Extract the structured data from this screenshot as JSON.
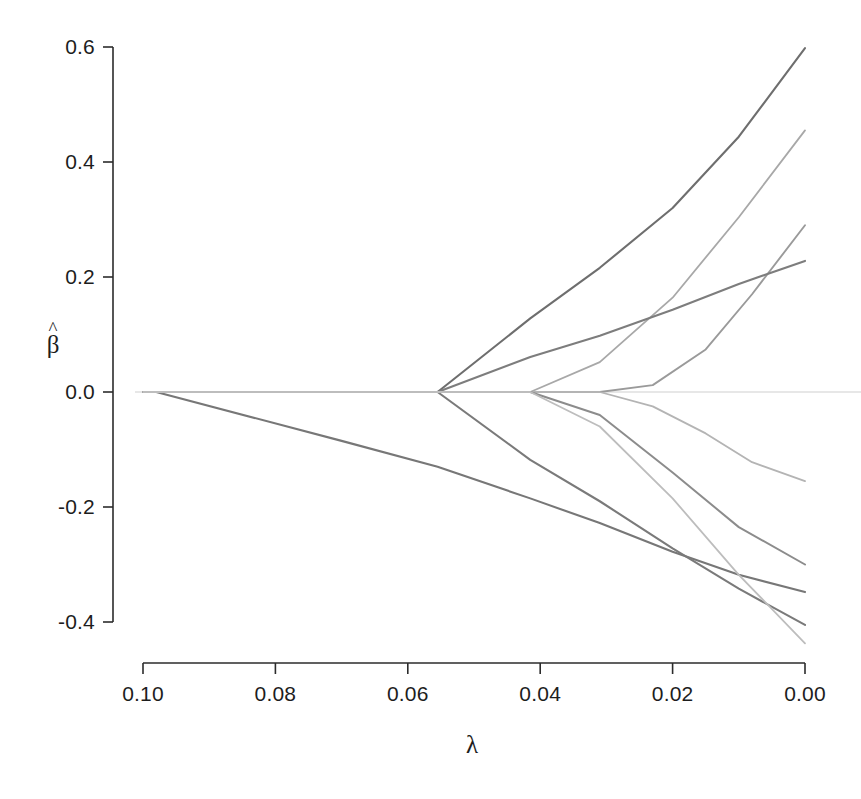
{
  "chart_data": {
    "type": "line",
    "title": "",
    "subtitle": "",
    "xlabel": "λ",
    "ylabel": "β̂",
    "ylabel_base": "β",
    "ylabel_accent": "^",
    "x_ticks": [
      "0.10",
      "0.08",
      "0.06",
      "0.04",
      "0.02",
      "0.00"
    ],
    "x_tick_values": [
      0.1,
      0.08,
      0.06,
      0.04,
      0.02,
      0.0
    ],
    "y_ticks": [
      "0.6",
      "0.4",
      "0.2",
      "0.0",
      "-0.2",
      "-0.4"
    ],
    "y_tick_values": [
      0.6,
      0.4,
      0.2,
      0.0,
      -0.2,
      -0.4
    ],
    "xlim": [
      0.1,
      0.0
    ],
    "ylim": [
      -0.4,
      0.6
    ],
    "x_axis_reversed": true,
    "grid": false,
    "legend": "none",
    "zero_reference_line": true,
    "zero_reference_value": 0.0,
    "axis_style": "r-base-box-less",
    "series": [
      {
        "name": "var1",
        "color": "#6e6e6e",
        "width": 2.1,
        "points": [
          [
            0.1,
            0.0
          ],
          [
            0.0555,
            0.0
          ],
          [
            0.0415,
            0.128
          ],
          [
            0.031,
            0.216
          ],
          [
            0.02,
            0.32
          ],
          [
            0.01,
            0.444
          ],
          [
            0.0,
            0.598
          ]
        ]
      },
      {
        "name": "var2",
        "color": "#a8a8a8",
        "width": 1.8,
        "points": [
          [
            0.1,
            0.0
          ],
          [
            0.0555,
            0.0
          ],
          [
            0.0415,
            0.0
          ],
          [
            0.031,
            0.052
          ],
          [
            0.02,
            0.164
          ],
          [
            0.01,
            0.304
          ],
          [
            0.0,
            0.455
          ]
        ]
      },
      {
        "name": "var3",
        "color": "#9a9a9a",
        "width": 1.9,
        "points": [
          [
            0.1,
            0.0
          ],
          [
            0.0555,
            0.0
          ],
          [
            0.0415,
            0.0
          ],
          [
            0.031,
            0.0
          ],
          [
            0.023,
            0.012
          ],
          [
            0.015,
            0.074
          ],
          [
            0.008,
            0.17
          ],
          [
            0.0,
            0.29
          ]
        ]
      },
      {
        "name": "var4",
        "color": "#7d7d7d",
        "width": 2.1,
        "points": [
          [
            0.1,
            0.0
          ],
          [
            0.0555,
            0.0
          ],
          [
            0.0415,
            0.061
          ],
          [
            0.031,
            0.098
          ],
          [
            0.02,
            0.143
          ],
          [
            0.01,
            0.188
          ],
          [
            0.0,
            0.228
          ]
        ]
      },
      {
        "name": "var5",
        "color": "#b4b4b4",
        "width": 1.8,
        "points": [
          [
            0.1,
            0.0
          ],
          [
            0.0555,
            0.0
          ],
          [
            0.0415,
            0.0
          ],
          [
            0.031,
            0.0
          ],
          [
            0.023,
            -0.025
          ],
          [
            0.015,
            -0.072
          ],
          [
            0.008,
            -0.122
          ],
          [
            0.0,
            -0.155
          ]
        ]
      },
      {
        "name": "var6",
        "color": "#8c8c8c",
        "width": 2.0,
        "points": [
          [
            0.1,
            0.0
          ],
          [
            0.0555,
            0.0
          ],
          [
            0.0415,
            0.0
          ],
          [
            0.031,
            -0.04
          ],
          [
            0.02,
            -0.14
          ],
          [
            0.01,
            -0.235
          ],
          [
            0.0,
            -0.3
          ]
        ]
      },
      {
        "name": "var7",
        "color": "#777777",
        "width": 2.1,
        "points": [
          [
            0.098,
            0.0
          ],
          [
            0.07,
            -0.085
          ],
          [
            0.0555,
            -0.13
          ],
          [
            0.0415,
            -0.185
          ],
          [
            0.031,
            -0.228
          ],
          [
            0.02,
            -0.278
          ],
          [
            0.01,
            -0.318
          ],
          [
            0.0,
            -0.348
          ]
        ]
      },
      {
        "name": "var8",
        "color": "#7a7a7a",
        "width": 2.1,
        "points": [
          [
            0.1,
            0.0
          ],
          [
            0.0555,
            0.0
          ],
          [
            0.0415,
            -0.118
          ],
          [
            0.031,
            -0.19
          ],
          [
            0.02,
            -0.272
          ],
          [
            0.01,
            -0.342
          ],
          [
            0.0,
            -0.405
          ]
        ]
      },
      {
        "name": "var9",
        "color": "#bdbdbd",
        "width": 1.8,
        "points": [
          [
            0.1,
            0.0
          ],
          [
            0.0555,
            0.0
          ],
          [
            0.0415,
            0.0
          ],
          [
            0.031,
            -0.06
          ],
          [
            0.02,
            -0.185
          ],
          [
            0.01,
            -0.318
          ],
          [
            0.0,
            -0.437
          ]
        ]
      }
    ],
    "branch_points_lambda": [
      0.098,
      0.0555,
      0.0415,
      0.031
    ],
    "endpoint_values_at_zero": [
      0.598,
      0.455,
      0.29,
      0.228,
      -0.155,
      -0.3,
      -0.348,
      -0.405,
      -0.437
    ]
  },
  "colors": {
    "axis": "#2b2b2b",
    "zero_line": "#cfcfcf",
    "background": "#ffffff",
    "text": "#1d1d1d"
  },
  "geometry": {
    "px_x_min": 143,
    "px_x_max": 805,
    "px_y_top": 47,
    "px_y_bottom": 622,
    "px_zero_y": 392,
    "x_axis_line_y": 663,
    "y_axis_line_x": 113
  }
}
